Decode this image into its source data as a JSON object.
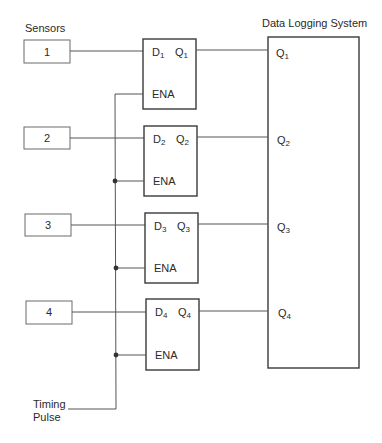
{
  "title": "Data Logging System",
  "sensors_label": "Sensors",
  "timing": {
    "line1": "Timing",
    "line2": "Pulse"
  },
  "colors": {
    "line": "#555555",
    "box": "#3a3a3a",
    "text": "#2a2a2a",
    "background": "#ffffff"
  },
  "sensors": [
    {
      "label": "1",
      "d": "D",
      "q": "Q",
      "sub": "1",
      "ena": "ENA",
      "out_q": "Q",
      "out_sub": "1"
    },
    {
      "label": "2",
      "d": "D",
      "q": "Q",
      "sub": "2",
      "ena": "ENA",
      "out_q": "Q",
      "out_sub": "2"
    },
    {
      "label": "3",
      "d": "D",
      "q": "Q",
      "sub": "3",
      "ena": "ENA",
      "out_q": "Q",
      "out_sub": "3"
    },
    {
      "label": "4",
      "d": "D",
      "q": "Q",
      "sub": "4",
      "ena": "ENA",
      "out_q": "Q",
      "out_sub": "4"
    }
  ]
}
